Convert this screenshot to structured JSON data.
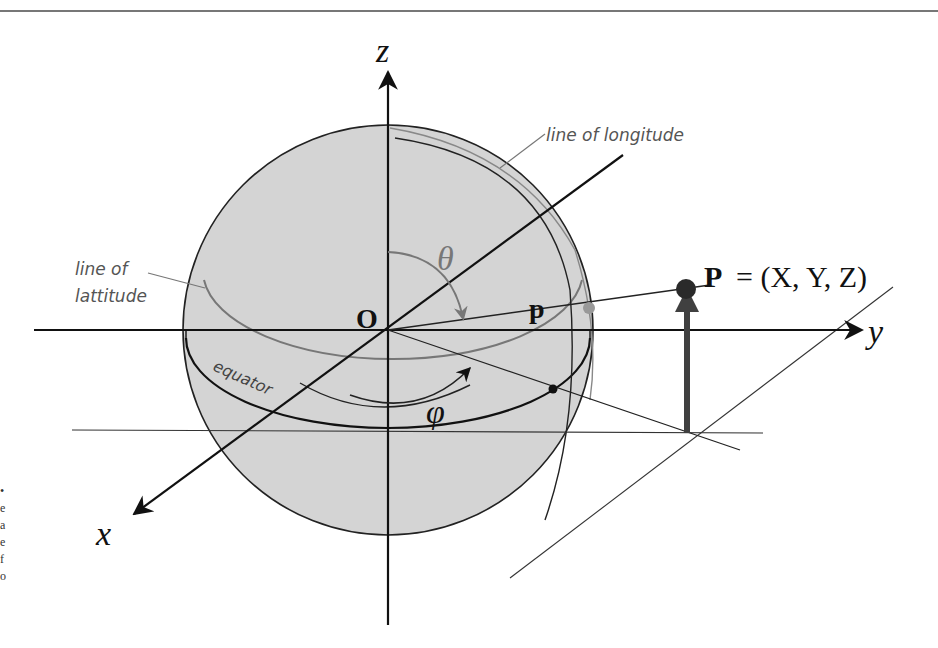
{
  "header": {
    "running_title": ""
  },
  "axes": {
    "x_label": "x",
    "y_label": "y",
    "z_label": "z",
    "origin_label": "O"
  },
  "labels": {
    "longitude": "line of longitude",
    "latitude_line1": "line of",
    "latitude_line2": "lattitude",
    "equator": "equator",
    "theta": "θ",
    "phi": "φ",
    "projected_point": "p",
    "point_bold": "P",
    "point_eq": "= (X, Y, Z)"
  },
  "margin_glyphs": [
    "•",
    "e",
    "a",
    "e",
    "f",
    "o"
  ],
  "colors": {
    "sphere_fill": "#d4d4d4",
    "stroke": "#111111",
    "gray_stroke": "#707070",
    "vector": "#404040"
  }
}
